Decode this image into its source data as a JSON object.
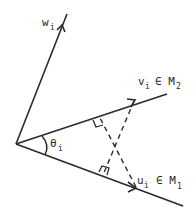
{
  "diagram": {
    "type": "vector-geometry",
    "vectors": [
      {
        "name": "w",
        "label": "w",
        "subscript": "i",
        "suffix": "",
        "suffix_sub": ""
      },
      {
        "name": "v",
        "label": "v",
        "subscript": "i",
        "suffix": "∈ M",
        "suffix_sub": "2"
      },
      {
        "name": "u",
        "label": "u",
        "subscript": "i",
        "suffix": "∈ M",
        "suffix_sub": "1"
      }
    ],
    "angle": {
      "label": "θ",
      "subscript": "i"
    },
    "colors": {
      "stroke": "#2a2a2a",
      "background": "#ffffff"
    }
  }
}
